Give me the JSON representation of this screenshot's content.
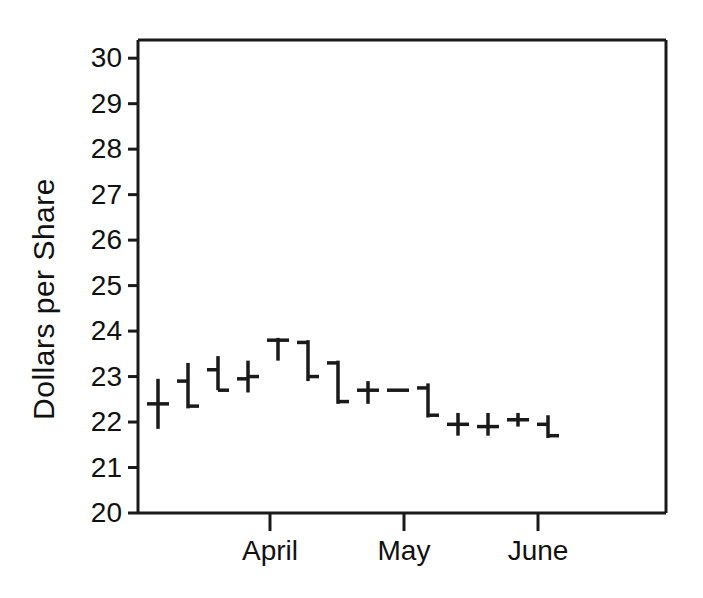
{
  "chart_data": {
    "type": "bar",
    "subtype": "ohlc-hlc-price-bars",
    "title": "",
    "xlabel": "",
    "ylabel": "Dollars per Share",
    "ylim": [
      20,
      30.4
    ],
    "yticks": [
      20,
      21,
      22,
      23,
      24,
      25,
      26,
      27,
      28,
      29,
      30
    ],
    "ytick_labels": [
      "20",
      "21",
      "22",
      "23",
      "24",
      "25",
      "26",
      "27",
      "28",
      "29",
      "30"
    ],
    "xtick_labels": [
      "April",
      "May",
      "June"
    ],
    "xtick_positions": [
      270,
      404,
      538
    ],
    "grid": false,
    "legend": null,
    "frame": "box",
    "series": [
      {
        "name": "Price bars",
        "fields": [
          "x",
          "high",
          "low",
          "open",
          "close"
        ],
        "bars": [
          {
            "x": 158,
            "high": 22.95,
            "low": 21.85,
            "open": 22.4,
            "close": 22.4
          },
          {
            "x": 188,
            "high": 23.3,
            "low": 22.3,
            "open": 22.9,
            "close": 22.35
          },
          {
            "x": 218,
            "high": 23.45,
            "low": 22.7,
            "open": 23.15,
            "close": 22.7
          },
          {
            "x": 248,
            "high": 23.35,
            "low": 22.65,
            "open": 22.95,
            "close": 23.0
          },
          {
            "x": 278,
            "high": 23.85,
            "low": 23.35,
            "open": 23.8,
            "close": 23.8
          },
          {
            "x": 308,
            "high": 23.8,
            "low": 22.9,
            "open": 23.75,
            "close": 23.0
          },
          {
            "x": 338,
            "high": 23.35,
            "low": 22.4,
            "open": 23.3,
            "close": 22.45
          },
          {
            "x": 368,
            "high": 22.9,
            "low": 22.4,
            "open": 22.7,
            "close": 22.7
          },
          {
            "x": 398,
            "high": 22.7,
            "low": 22.7,
            "open": 22.7,
            "close": 22.7
          },
          {
            "x": 428,
            "high": 22.85,
            "low": 22.1,
            "open": 22.75,
            "close": 22.15
          },
          {
            "x": 458,
            "high": 22.2,
            "low": 21.7,
            "open": 21.95,
            "close": 21.95
          },
          {
            "x": 488,
            "high": 22.2,
            "low": 21.7,
            "open": 21.9,
            "close": 21.9
          },
          {
            "x": 518,
            "high": 22.2,
            "low": 21.9,
            "open": 22.05,
            "close": 22.05
          },
          {
            "x": 548,
            "high": 22.15,
            "low": 21.65,
            "open": 21.95,
            "close": 21.7
          }
        ]
      }
    ]
  },
  "axis": {
    "plot_left": 138,
    "plot_right": 666,
    "plot_top": 40,
    "plot_bottom": 513,
    "y_min": 20,
    "y_max": 30.4,
    "tick_len": 10,
    "line_color": "#1a1a1a",
    "line_width": 3,
    "bar_color": "#1a1a1a",
    "bar_line_width": 3.5,
    "tick_arm": 11
  }
}
